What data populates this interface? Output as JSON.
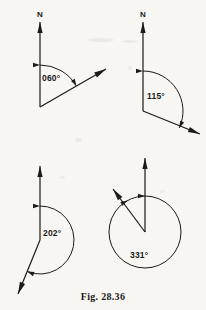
{
  "figure": {
    "caption": "Fig. 28.36",
    "ink_color": "#1a1a1a",
    "paper_color": "#f7f6f2",
    "diagrams": [
      {
        "id": "bearing-060",
        "angle_label": "060°",
        "north_label": "N",
        "bearing_degrees": 60,
        "vertex": {
          "x": 40,
          "y": 107
        },
        "north_tip": {
          "x": 40,
          "y": 22
        },
        "ray_tip": {
          "x": 106,
          "y": 69
        },
        "arc_radius": 42,
        "label_position": {
          "x": 42,
          "y": 81
        },
        "arc_style": "minor",
        "has_full_circle": false
      },
      {
        "id": "bearing-115",
        "angle_label": "115°",
        "north_label": "N",
        "bearing_degrees": 115,
        "vertex": {
          "x": 143,
          "y": 111
        },
        "north_tip": {
          "x": 143,
          "y": 22
        },
        "ray_tip": {
          "x": 200,
          "y": 134
        },
        "arc_radius": 40,
        "label_position": {
          "x": 147,
          "y": 99
        },
        "arc_style": "minor",
        "has_full_circle": false
      },
      {
        "id": "bearing-202",
        "angle_label": "202°",
        "north_label": "",
        "bearing_degrees": 202,
        "vertex": {
          "x": 40,
          "y": 240
        },
        "north_tip": {
          "x": 40,
          "y": 166
        },
        "ray_tip": {
          "x": 18,
          "y": 294
        },
        "arc_radius": 34,
        "label_position": {
          "x": 43,
          "y": 236
        },
        "arc_style": "reflex",
        "has_full_circle": false
      },
      {
        "id": "bearing-331",
        "angle_label": "331°",
        "north_label": "",
        "bearing_degrees": 331,
        "vertex": {
          "x": 145,
          "y": 232
        },
        "north_tip": {
          "x": 145,
          "y": 158
        },
        "ray_tip": {
          "x": 113,
          "y": 189
        },
        "arc_radius": 36,
        "label_position": {
          "x": 130,
          "y": 258
        },
        "arc_style": "reflex",
        "has_full_circle": true
      }
    ]
  }
}
